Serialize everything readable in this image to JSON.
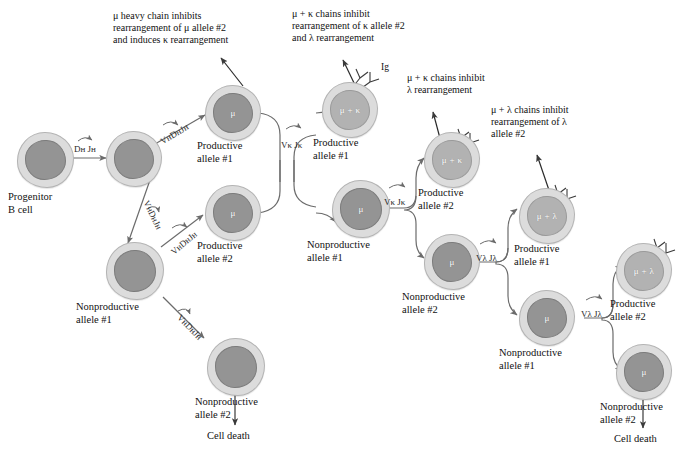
{
  "figure": {
    "type": "flow-diagram",
    "colors": {
      "cell_cytoplasm": "#dcdcdc",
      "nucleus_dark": "#949494",
      "nucleus_light": "#b2b2b2",
      "arrow": "#6b6b6b",
      "text": "#111111",
      "background": "#ffffff"
    }
  },
  "annotations": [
    {
      "id": "annot-mu-heavy",
      "text": "μ heavy chain inhibits\nrearrangement of μ allele #2\nand induces κ rearrangement"
    },
    {
      "id": "annot-mu-kappa",
      "text": "μ + κ chains inhibit\nrearrangement of κ allele #2\nand λ rearrangement"
    },
    {
      "id": "annot-mu-kappa-lambda",
      "text": "μ + κ chains inhibit\nλ rearrangement"
    },
    {
      "id": "annot-mu-lambda",
      "text": "μ + λ chains inhibit\nrearrangement of λ\nallele #2"
    }
  ],
  "cells": [
    {
      "id": "cell-progenitor",
      "nucleus_label": "",
      "caption": "Progenitor\nB cell",
      "shade": "dark"
    },
    {
      "id": "cell-dj-rearranged",
      "nucleus_label": "",
      "caption": "",
      "shade": "dark"
    },
    {
      "id": "cell-productive-h1",
      "nucleus_label": "μ",
      "caption": "Productive\nallele #1",
      "shade": "dark"
    },
    {
      "id": "cell-nonproductive-h1",
      "nucleus_label": "",
      "caption": "Nonproductive\nallele #1",
      "shade": "dark"
    },
    {
      "id": "cell-productive-h2",
      "nucleus_label": "μ",
      "caption": "Productive\nallele #2",
      "shade": "dark"
    },
    {
      "id": "cell-nonproductive-h2",
      "nucleus_label": "",
      "caption": "Nonproductive\nallele #2",
      "shade": "dark"
    },
    {
      "id": "cell-productive-k1",
      "nucleus_label": "μ + κ",
      "caption": "Productive\nallele #1",
      "shade": "light"
    },
    {
      "id": "cell-nonproductive-k1",
      "nucleus_label": "μ",
      "caption": "Nonproductive\nallele #1",
      "shade": "dark"
    },
    {
      "id": "cell-productive-k2",
      "nucleus_label": "μ + κ",
      "caption": "Productive\nallele #2",
      "shade": "light"
    },
    {
      "id": "cell-nonproductive-k2",
      "nucleus_label": "μ",
      "caption": "Nonproductive\nallele #2",
      "shade": "dark"
    },
    {
      "id": "cell-productive-l1",
      "nucleus_label": "μ + λ",
      "caption": "Productive\nallele #1",
      "shade": "light"
    },
    {
      "id": "cell-nonproductive-l1",
      "nucleus_label": "μ",
      "caption": "Nonproductive\nallele #1",
      "shade": "dark"
    },
    {
      "id": "cell-productive-l2",
      "nucleus_label": "μ + λ",
      "caption": "Productive\nallele #2",
      "shade": "light"
    },
    {
      "id": "cell-nonproductive-l2-right",
      "nucleus_label": "μ",
      "caption": "Nonproductive\nallele #2",
      "shade": "dark"
    }
  ],
  "segment_labels": [
    {
      "id": "seg-dh-jh",
      "parts": [
        "D",
        "H",
        " J",
        "H"
      ],
      "text": "Dʜ Jʜ"
    },
    {
      "id": "seg-vh-dh-jh-1",
      "text": "VʜDʜJʜ"
    },
    {
      "id": "seg-vh-dh-jh-2",
      "text": "VʜDʜJʜ"
    },
    {
      "id": "seg-vh-dh-jh-3",
      "text": "VʜDʜJʜ"
    },
    {
      "id": "seg-vh-dh-jh-4",
      "text": "VʜDʜJʜ"
    },
    {
      "id": "seg-vk-jk-1",
      "text": "Vκ Jκ"
    },
    {
      "id": "seg-vk-jk-2",
      "text": "Vκ Jκ"
    },
    {
      "id": "seg-vl-jl-1",
      "text": "Vλ Jλ"
    },
    {
      "id": "seg-vl-jl-2",
      "text": "Vλ Jλ"
    }
  ],
  "ig_labels": [
    {
      "id": "ig-label",
      "text": "Ig"
    }
  ],
  "outcomes": [
    {
      "id": "cell-death-left",
      "text": "Cell death"
    },
    {
      "id": "cell-death-right",
      "text": "Cell death"
    }
  ]
}
